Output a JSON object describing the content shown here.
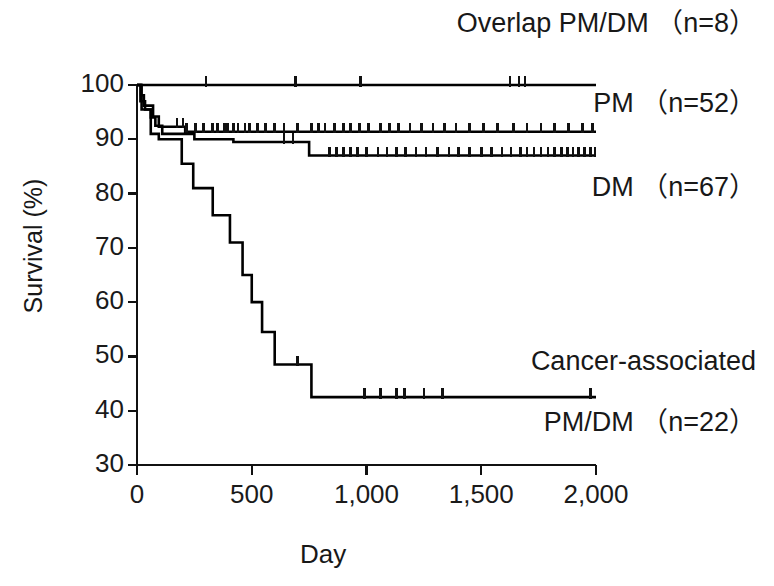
{
  "chart_data": {
    "type": "line",
    "subtype": "kaplan-meier-survival",
    "title": "",
    "xlabel": "Day",
    "ylabel": "Survival (%)",
    "xlim": [
      0,
      2000
    ],
    "ylim": [
      30,
      100
    ],
    "xticks": [
      0,
      500,
      1000,
      1500,
      2000
    ],
    "xticklabels": [
      "0",
      "500",
      "1,000",
      "1,500",
      "2,000"
    ],
    "yticks": [
      30,
      40,
      50,
      60,
      70,
      80,
      90,
      100
    ],
    "yticklabels": [
      "30",
      "40",
      "50",
      "60",
      "70",
      "80",
      "90",
      "100"
    ],
    "grid": false,
    "legend_position": "inline-right",
    "line_color": "#000000",
    "series": [
      {
        "name": "Overlap PM/DM",
        "n": 8,
        "label": "Overlap PM/DM （n=8）",
        "steps": [
          [
            0,
            100
          ],
          [
            2000,
            100
          ]
        ],
        "censor_days": [
          300,
          690,
          975,
          1625,
          1665,
          1690
        ]
      },
      {
        "name": "PM",
        "n": 52,
        "label": "PM （n=52）",
        "steps": [
          [
            0,
            100
          ],
          [
            18,
            98.1
          ],
          [
            30,
            96.2
          ],
          [
            55,
            96.2
          ],
          [
            70,
            94.2
          ],
          [
            95,
            92.3
          ],
          [
            150,
            92.3
          ],
          [
            210,
            91.4
          ],
          [
            2000,
            91.4
          ]
        ],
        "censor_days": [
          175,
          200,
          215,
          255,
          290,
          330,
          350,
          380,
          395,
          420,
          440,
          470,
          490,
          525,
          560,
          600,
          640,
          700,
          760,
          790,
          820,
          860,
          900,
          930,
          970,
          1010,
          1060,
          1100,
          1140,
          1190,
          1240,
          1290,
          1340,
          1390,
          1450,
          1510,
          1570,
          1640,
          1700,
          1760,
          1820,
          1880,
          1940,
          1985
        ]
      },
      {
        "name": "DM",
        "n": 67,
        "label": "DM （n=67）",
        "steps": [
          [
            0,
            100
          ],
          [
            15,
            97.0
          ],
          [
            35,
            95.5
          ],
          [
            60,
            94.0
          ],
          [
            80,
            92.5
          ],
          [
            110,
            91.0
          ],
          [
            250,
            90.0
          ],
          [
            420,
            89.5
          ],
          [
            560,
            89.5
          ],
          [
            750,
            87.0
          ],
          [
            2000,
            87.0
          ]
        ],
        "censor_days": [
          640,
          680,
          840,
          870,
          900,
          930,
          960,
          1000,
          1050,
          1090,
          1130,
          1170,
          1215,
          1260,
          1310,
          1360,
          1400,
          1450,
          1500,
          1545,
          1590,
          1630,
          1670,
          1700,
          1730,
          1760,
          1790,
          1820,
          1850,
          1875,
          1900,
          1925,
          1950,
          1975,
          1995
        ]
      },
      {
        "name": "Cancer-associated PM/DM",
        "n": 22,
        "label_line1": "Cancer-associated",
        "label_line2": "PM/DM （n=22）",
        "steps": [
          [
            0,
            100
          ],
          [
            20,
            95.5
          ],
          [
            60,
            91.0
          ],
          [
            95,
            90.0
          ],
          [
            180,
            90.0
          ],
          [
            195,
            85.5
          ],
          [
            245,
            81.0
          ],
          [
            300,
            81.0
          ],
          [
            330,
            76.0
          ],
          [
            390,
            76.0
          ],
          [
            405,
            71.0
          ],
          [
            440,
            71.0
          ],
          [
            460,
            65.0
          ],
          [
            490,
            65.0
          ],
          [
            500,
            60.0
          ],
          [
            530,
            60.0
          ],
          [
            545,
            54.5
          ],
          [
            585,
            54.5
          ],
          [
            600,
            48.5
          ],
          [
            745,
            48.5
          ],
          [
            760,
            42.5
          ],
          [
            2000,
            42.5
          ]
        ],
        "censor_days": [
          700,
          990,
          1060,
          1130,
          1165,
          1250,
          1330,
          1975
        ]
      }
    ]
  },
  "axes": {
    "y_axis_label": "Survival (%)",
    "x_axis_label": "Day"
  }
}
